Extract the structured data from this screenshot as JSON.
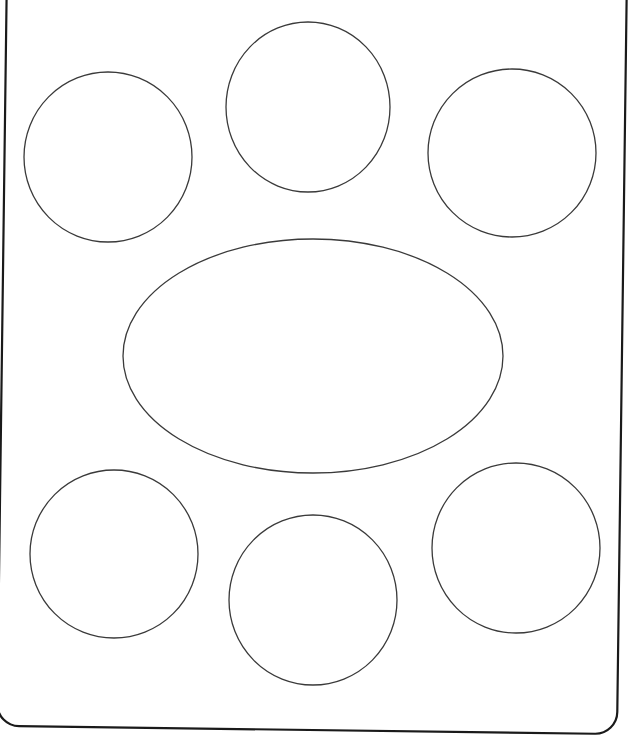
{
  "document": {
    "title": "Table setting layout diagram",
    "background_color": "#ffffff",
    "canvas": {
      "width": 632,
      "height": 744
    }
  },
  "style": {
    "frame_stroke_color": "#1a1a1a",
    "frame_stroke_width": 2.2,
    "shape_stroke_color": "#3a3a3a",
    "shape_stroke_width": 1.3,
    "shape_fill": "none"
  },
  "frame": {
    "name": "placemat-outline",
    "shape": "rounded-rectangle",
    "corner_radius": 22,
    "rotation_degrees": 0.75,
    "x": 2,
    "y": -30,
    "width": 620,
    "height": 760,
    "note": "top edge extends above the visible image area"
  },
  "chart_data": {
    "type": "scatter",
    "xlabel": "",
    "ylabel": "",
    "xlim": [
      0,
      632
    ],
    "ylim": [
      0,
      744
    ],
    "grid": false,
    "legend": "none",
    "shapes": [
      {
        "id": "circle-top-left",
        "label": "Circle 1",
        "kind": "circle",
        "cx": 108,
        "cy": 157,
        "rx": 84,
        "ry": 85
      },
      {
        "id": "circle-top-center",
        "label": "Circle 2",
        "kind": "circle",
        "cx": 308,
        "cy": 107,
        "rx": 82,
        "ry": 85
      },
      {
        "id": "circle-top-right",
        "label": "Circle 3",
        "kind": "circle",
        "cx": 512,
        "cy": 153,
        "rx": 84,
        "ry": 84
      },
      {
        "id": "ellipse-center",
        "label": "Ellipse",
        "kind": "ellipse",
        "cx": 313,
        "cy": 356,
        "rx": 190,
        "ry": 117
      },
      {
        "id": "circle-bottom-left",
        "label": "Circle 4",
        "kind": "circle",
        "cx": 114,
        "cy": 554,
        "rx": 84,
        "ry": 84
      },
      {
        "id": "circle-bottom-center",
        "label": "Circle 5",
        "kind": "circle",
        "cx": 313,
        "cy": 600,
        "rx": 84,
        "ry": 85
      },
      {
        "id": "circle-bottom-right",
        "label": "Circle 6",
        "kind": "circle",
        "cx": 516,
        "cy": 548,
        "rx": 84,
        "ry": 85
      }
    ]
  }
}
